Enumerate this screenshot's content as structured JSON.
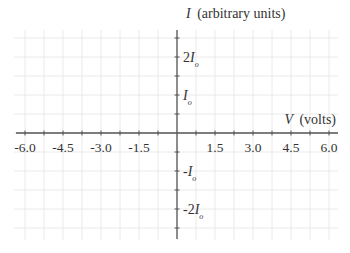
{
  "chart_data": {
    "type": "line",
    "title": "",
    "xlabel": "V (volts)",
    "xlabel_var": "V",
    "xlabel_unit": "(volts)",
    "ylabel": "I (arbitrary units)",
    "ylabel_var": "I",
    "ylabel_unit": "(arbitrary units)",
    "xlim": [
      -6.0,
      6.0
    ],
    "ylim": [
      -2.5,
      2.5
    ],
    "x_tick_step": 0.75,
    "y_tick_step": 0.5,
    "x_tick_labels": [
      {
        "value": -6.0,
        "label": "-6.0"
      },
      {
        "value": -4.5,
        "label": "-4.5"
      },
      {
        "value": -3.0,
        "label": "-3.0"
      },
      {
        "value": -1.5,
        "label": "-1.5"
      },
      {
        "value": 1.5,
        "label": "1.5"
      },
      {
        "value": 3.0,
        "label": "3.0"
      },
      {
        "value": 4.5,
        "label": "4.5"
      },
      {
        "value": 6.0,
        "label": "6.0"
      }
    ],
    "y_tick_labels": [
      {
        "value": 2,
        "coef": "2",
        "sign": "",
        "var": "I",
        "sub": "o"
      },
      {
        "value": 1,
        "coef": "",
        "sign": "",
        "var": "I",
        "sub": "o"
      },
      {
        "value": -1,
        "coef": "",
        "sign": "-",
        "var": "I",
        "sub": "o"
      },
      {
        "value": -2,
        "coef": "2",
        "sign": "-",
        "var": "I",
        "sub": "o"
      }
    ],
    "grid": true,
    "series": [],
    "legend": null,
    "colors": {
      "axis": "#555555",
      "grid": "#e4e4e4",
      "text": "#333333"
    }
  }
}
